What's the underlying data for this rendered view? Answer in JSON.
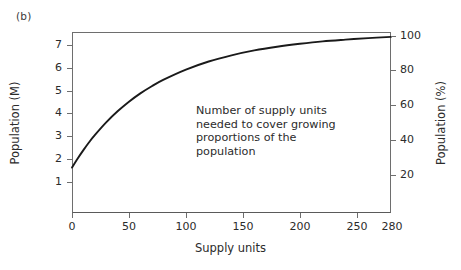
{
  "panel": {
    "label": "(b)"
  },
  "chart_data": {
    "type": "line",
    "title": "",
    "subtitle": "",
    "panel_label": "(b)",
    "xlabel": "Supply units",
    "ylabel": "Population (M)",
    "ylabel_right": "Population (%)",
    "xlim": [
      0,
      280
    ],
    "ylim": [
      0,
      7.37
    ],
    "ylim_right": [
      0,
      105
    ],
    "grid": false,
    "legend": false,
    "legend_position": "none",
    "xticks": [
      0,
      50,
      100,
      150,
      200,
      250,
      280
    ],
    "xticklabels": [
      "0",
      "50",
      "100",
      "150",
      "200",
      "250",
      "280"
    ],
    "yticks": [
      1,
      2,
      3,
      4,
      5,
      6,
      7
    ],
    "yticklabels": [
      "1",
      "2",
      "3",
      "4",
      "5",
      "6",
      "7"
    ],
    "yticks_right": [
      20,
      40,
      60,
      80,
      100
    ],
    "yticklabels_right": [
      "20",
      "40",
      "60",
      "80",
      "100"
    ],
    "line_color": "#1a1a1a",
    "axis_color": "#6e6e6e",
    "annotations": [
      {
        "text_lines": [
          "Number of supply units",
          "needed to cover growing",
          "proportions of the",
          "population"
        ],
        "x": 110,
        "y": 5.1
      }
    ],
    "series": [
      {
        "name": "Population covered",
        "x": [
          0,
          5,
          10,
          15,
          20,
          30,
          40,
          50,
          60,
          70,
          80,
          100,
          120,
          140,
          160,
          180,
          200,
          220,
          240,
          260,
          280
        ],
        "y": [
          1.85,
          2.22,
          2.56,
          2.88,
          3.17,
          3.69,
          4.14,
          4.53,
          4.87,
          5.16,
          5.42,
          5.84,
          6.17,
          6.42,
          6.62,
          6.77,
          6.89,
          6.99,
          7.06,
          7.12,
          7.17
        ],
        "y_percent": [
          25,
          30,
          35,
          39,
          43,
          50,
          56,
          61,
          66,
          70,
          74,
          79,
          84,
          87,
          90,
          92,
          94,
          95,
          96,
          97,
          97
        ]
      }
    ]
  },
  "axes": {
    "left": {
      "title": "Population (M)",
      "ticks": [
        {
          "label": "7",
          "value": 7
        },
        {
          "label": "6",
          "value": 6
        },
        {
          "label": "5",
          "value": 5
        },
        {
          "label": "4",
          "value": 4
        },
        {
          "label": "3",
          "value": 3
        },
        {
          "label": "2",
          "value": 2
        },
        {
          "label": "1",
          "value": 1
        }
      ]
    },
    "right": {
      "title": "Population (%)",
      "ticks": [
        {
          "label": "100",
          "value": 100
        },
        {
          "label": "80",
          "value": 80
        },
        {
          "label": "60",
          "value": 60
        },
        {
          "label": "40",
          "value": 40
        },
        {
          "label": "20",
          "value": 20
        }
      ]
    },
    "bottom": {
      "title": "Supply units",
      "ticks": [
        {
          "label": "0",
          "value": 0
        },
        {
          "label": "50",
          "value": 50
        },
        {
          "label": "100",
          "value": 100
        },
        {
          "label": "150",
          "value": 150
        },
        {
          "label": "200",
          "value": 200
        },
        {
          "label": "250",
          "value": 250
        },
        {
          "label": "280",
          "value": 280
        }
      ]
    }
  },
  "annotation": {
    "line1": "Number of supply units",
    "line2": "needed to cover growing",
    "line3": "proportions of the",
    "line4": "population"
  }
}
